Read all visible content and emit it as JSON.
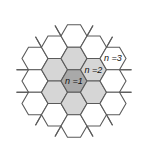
{
  "diagram": {
    "center": [
      74,
      81
    ],
    "hex_radius": 13,
    "max_ring": 2,
    "stub_length": 12,
    "colors": {
      "line": "#5a5a5a",
      "background": "#ffffff",
      "ring1_fill": "#a9a9a9",
      "ring2_fill": "#d6d6d6",
      "default_fill": "#ffffff"
    },
    "shaded": [
      {
        "q": 0,
        "r": 0,
        "fill": "ring1"
      },
      {
        "q": 0,
        "r": -1,
        "fill": "ring2"
      },
      {
        "q": 1,
        "r": -1,
        "fill": "ring2"
      },
      {
        "q": 1,
        "r": 0,
        "fill": "ring2"
      },
      {
        "q": 0,
        "r": 1,
        "fill": "ring2"
      },
      {
        "q": -1,
        "r": 1,
        "fill": "ring2"
      },
      {
        "q": -1,
        "r": 0,
        "fill": "ring2"
      }
    ],
    "labels": [
      {
        "text": "n =1",
        "q": 0,
        "r": 0
      },
      {
        "text": "n =2",
        "q": 1,
        "r": -1
      },
      {
        "text": "n =3",
        "q": 2,
        "r": -2
      }
    ]
  }
}
